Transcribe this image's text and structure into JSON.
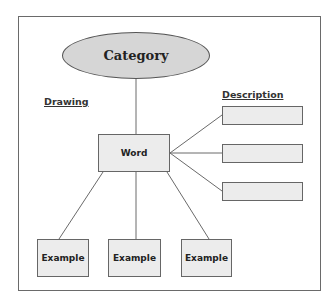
{
  "diagram": {
    "category": "Category",
    "drawing_label": "Drawing",
    "description_label": "Description",
    "word": "Word",
    "descriptions": [
      "",
      "",
      ""
    ],
    "examples": [
      "Example",
      "Example",
      "Example"
    ]
  },
  "colors": {
    "ellipse_fill": "#d6d6d6",
    "box_fill": "#ececec",
    "stroke": "#666666"
  }
}
